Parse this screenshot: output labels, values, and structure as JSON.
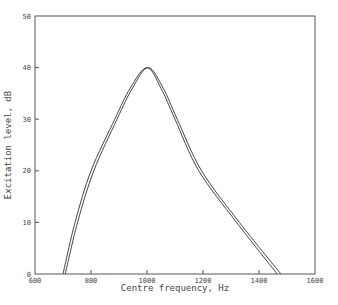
{
  "chart_data": {
    "type": "line",
    "title": "",
    "xlabel": "Centre frequency, Hz",
    "ylabel": "Excitation level, dB",
    "xlim": [
      600,
      1600
    ],
    "ylim": [
      0,
      50
    ],
    "xticks": [
      600,
      800,
      1000,
      1200,
      1400,
      1600
    ],
    "yticks": [
      0,
      10,
      20,
      30,
      40,
      50
    ],
    "grid": false,
    "legend": null,
    "series": [
      {
        "name": "curve-1",
        "x": [
          700,
          743,
          800,
          885,
          940,
          1000,
          1050,
          1100,
          1185,
          1320,
          1465
        ],
        "y": [
          0,
          10,
          20,
          30,
          36,
          40,
          36,
          30,
          20,
          10,
          0
        ]
      },
      {
        "name": "curve-2",
        "x": [
          708,
          752,
          810,
          893,
          948,
          1004,
          1058,
          1108,
          1195,
          1330,
          1478
        ],
        "y": [
          0,
          10,
          20,
          30,
          36,
          40,
          36,
          30,
          20,
          10,
          0
        ]
      }
    ]
  },
  "colors": {
    "axis": "#555555",
    "line": "#444444"
  }
}
